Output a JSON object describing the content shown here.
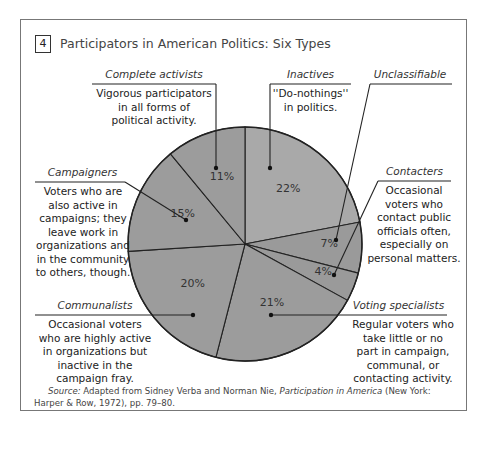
{
  "figure_number": "4",
  "title": "Participators in American Politics: Six Types",
  "chart_data": {
    "type": "pie",
    "title": "Participators in American Politics: Six Types",
    "categories": [
      "Inactives",
      "Unclassifiable",
      "Contacters",
      "Voting specialists",
      "Communalists",
      "Campaigners",
      "Complete activists"
    ],
    "values": [
      22,
      7,
      4,
      21,
      20,
      15,
      11
    ],
    "unit": "%",
    "note": "Unclassifiable (7%) and Contacters (4%) slices on the right; labels connected by leader lines"
  },
  "slices": [
    {
      "name": "Inactives",
      "pct_label": "22%"
    },
    {
      "name": "Unclassifiable",
      "pct_label": "7%"
    },
    {
      "name": "Contacters",
      "pct_label": "4%"
    },
    {
      "name": "Voting specialists",
      "pct_label": "21%"
    },
    {
      "name": "Communalists",
      "pct_label": "20%"
    },
    {
      "name": "Campaigners",
      "pct_label": "15%"
    },
    {
      "name": "Complete activists",
      "pct_label": "11%"
    }
  ],
  "labels": {
    "complete_activists": {
      "title": "Complete activists",
      "desc": [
        "Vigorous participators",
        "in all forms of",
        "political activity."
      ]
    },
    "inactives": {
      "title": "Inactives",
      "desc": [
        "''Do-nothings''",
        "in politics."
      ]
    },
    "unclassifiable": {
      "title": "Unclassifiable"
    },
    "campaigners": {
      "title": "Campaigners",
      "desc": [
        "Voters who are",
        "also active in",
        "campaigns; they",
        "leave work in",
        "organizations and",
        "in the community",
        "to others, though."
      ]
    },
    "contacters": {
      "title": "Contacters",
      "desc": [
        "Occasional",
        "voters who",
        "contact public",
        "officials often,",
        "especially on",
        "personal matters."
      ]
    },
    "communalists": {
      "title": "Communalists",
      "desc": [
        "Occasional voters",
        "who are highly active",
        "in organizations but",
        "inactive in the",
        "campaign fray."
      ]
    },
    "voting_specialists": {
      "title": "Voting specialists",
      "desc": [
        "Regular voters who",
        "take little or no",
        "part in campaign,",
        "communal, or",
        "contacting activity."
      ]
    }
  },
  "source": {
    "label": "Source:",
    "text_before": " Adapted from Sidney Verba and Norman Nie, ",
    "book": "Participation in America",
    "text_after": " (New York: Harper & Row, 1972), pp. 79–80."
  }
}
